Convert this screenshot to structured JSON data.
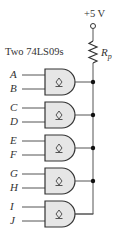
{
  "title": "Two 74LS09s",
  "supply": {
    "label": "+5 V"
  },
  "resistor": {
    "label": "R",
    "subscript": "p"
  },
  "gate_symbol": "open-collector",
  "gates": [
    {
      "inputs": [
        "A",
        "B"
      ]
    },
    {
      "inputs": [
        "C",
        "D"
      ]
    },
    {
      "inputs": [
        "E",
        "F"
      ]
    },
    {
      "inputs": [
        "G",
        "H"
      ]
    },
    {
      "inputs": [
        "I",
        "J"
      ]
    }
  ],
  "colors": {
    "gate_fill": "#e6e6e6",
    "stroke": "#333333",
    "wire": "#555555"
  }
}
